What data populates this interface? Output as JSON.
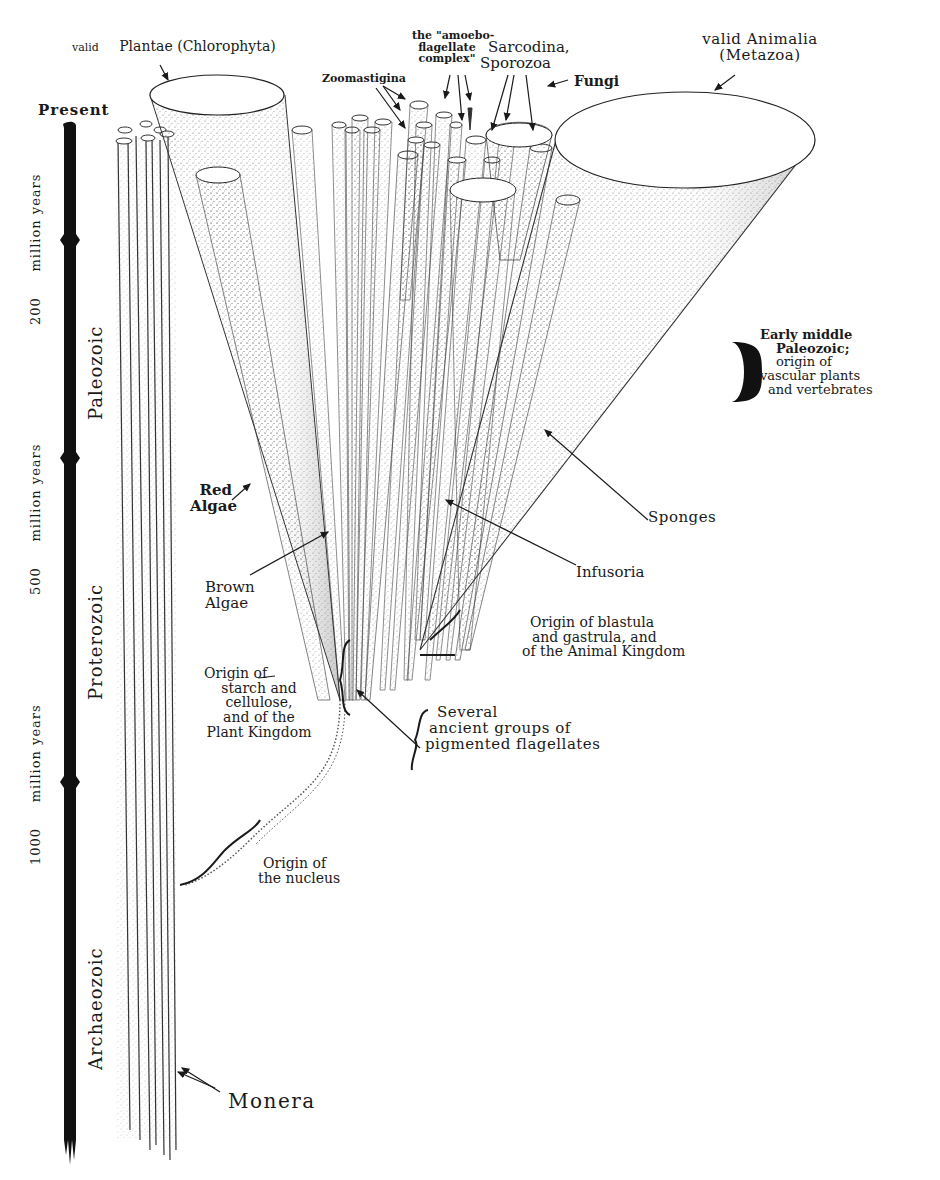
{
  "figure": {
    "timeline": {
      "present_label": "Present",
      "eras": [
        {
          "name": "Paleozoic"
        },
        {
          "name": "Proterozoic"
        },
        {
          "name": "Archaeozoic"
        }
      ],
      "durations": [
        {
          "value": "200",
          "unit": "million years"
        },
        {
          "value": "500",
          "unit": "million years"
        },
        {
          "value": "1000",
          "unit": "million years"
        }
      ]
    },
    "groups": {
      "plantae": {
        "line1": "valid",
        "line2": "Plantae (Chlorophyta)"
      },
      "animalia": {
        "line1": "valid Animalia",
        "line2": "(Metazoa)"
      },
      "zoomastigina": "Zoomastigina",
      "amoeboflagellate": [
        "the \"amoebo-",
        "flagellate",
        "complex\""
      ],
      "sarcodina": [
        "Sarcodina,",
        "Sporozoa"
      ],
      "fungi": "Fungi",
      "red_algae": [
        "Red",
        "Algae"
      ],
      "brown_algae": [
        "Brown",
        "Algae"
      ],
      "sponges": "Sponges",
      "infusoria": "Infusoria",
      "monera": "Monera"
    },
    "annotations": {
      "early_paleozoic": [
        "Early middle",
        "Paleozoic;",
        "origin of",
        "vascular plants",
        "and vertebrates"
      ],
      "blastula": [
        "Origin of blastula",
        "and gastrula, and",
        "of the Animal Kingdom"
      ],
      "starch": [
        "Origin of",
        "starch and",
        "cellulose,",
        "and of the",
        "Plant Kingdom"
      ],
      "flagellates": [
        "Several",
        "ancient groups of",
        "pigmented flagellates"
      ],
      "nucleus": [
        "Origin of",
        "the nucleus"
      ]
    },
    "colors": {
      "ink": "#1a1a1a",
      "stipple": "#555555",
      "background": "#ffffff"
    }
  }
}
